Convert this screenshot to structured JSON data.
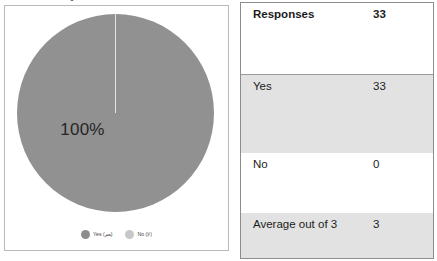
{
  "chart_panel": {
    "cutoff_title": "Questionnaire Results",
    "center_label": "100%",
    "legend": [
      {
        "label": "Yes (نعم)",
        "color": "#8c8c8c",
        "name": "legend-item-yes"
      },
      {
        "label": "No (لا)",
        "color": "#c7c7c7",
        "name": "legend-item-no"
      }
    ]
  },
  "table": {
    "rows": [
      {
        "label": "Responses",
        "value": "33"
      },
      {
        "label": "Yes",
        "value": "33"
      },
      {
        "label": "No",
        "value": "0"
      },
      {
        "label": "Average out of 3",
        "value": "3"
      }
    ]
  },
  "chart_data": {
    "type": "pie",
    "title": "Questionnaire Results",
    "categories": [
      "Yes (نعم)",
      "No (لا)"
    ],
    "values": [
      33,
      0
    ],
    "percentages": [
      100,
      0
    ],
    "data_labels": [
      "100%"
    ],
    "colors": [
      "#919191",
      "#c7c7c7"
    ],
    "legend_position": "bottom",
    "grid": false,
    "total_responses": 33,
    "table": {
      "type": "table",
      "rows": [
        {
          "label": "Responses",
          "value": 33
        },
        {
          "label": "Yes",
          "value": 33
        },
        {
          "label": "No",
          "value": 0
        },
        {
          "label": "Average out of 3",
          "value": 3
        }
      ]
    }
  }
}
